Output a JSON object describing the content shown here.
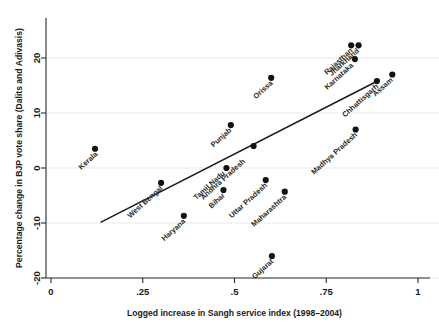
{
  "chart_data": {
    "type": "scatter",
    "title": "",
    "xlabel": "Logged increase in Sangh service index (1998–2004)",
    "ylabel": "Percentage change in BJP vote share (Dalits and Adivasis)",
    "xlim": [
      0,
      1
    ],
    "ylim": [
      -22,
      23.5
    ],
    "xticks": [
      0,
      0.25,
      0.5,
      0.75,
      1
    ],
    "xticklabels": [
      "0",
      ".25",
      ".5",
      ".75",
      "1"
    ],
    "yticks": [
      -20,
      -10,
      0,
      10,
      20
    ],
    "yticklabels": [
      "-20",
      "-10",
      "0",
      "10",
      "20"
    ],
    "grid": "horizontal",
    "legend": "none",
    "marker_color": "#121212",
    "fit_line_color": "#1a1a1a",
    "fit_line": {
      "x_start": 0.135,
      "y_start": -9.9,
      "x_end": 0.895,
      "y_end": 16.0
    },
    "points": [
      {
        "label": "Kerala",
        "x": 0.12,
        "y": 3.5,
        "label_angle": -42,
        "label_dx": 3,
        "label_dy": 6
      },
      {
        "label": "West Bengal",
        "x": 0.3,
        "y": -2.7,
        "label_angle": -42,
        "label_dx": 2,
        "label_dy": 6
      },
      {
        "label": "Haryana",
        "x": 0.362,
        "y": -8.7,
        "label_angle": -42,
        "label_dx": 2,
        "label_dy": 6
      },
      {
        "label": "Bihar",
        "x": 0.47,
        "y": -4.0,
        "label_angle": -42,
        "label_dx": 2,
        "label_dy": 6
      },
      {
        "label": "Tamil Nadu",
        "x": 0.478,
        "y": 0.0,
        "label_angle": -42,
        "label_dx": -1,
        "label_dy": 6
      },
      {
        "label": "Punjab",
        "x": 0.49,
        "y": 7.8,
        "label_angle": -42,
        "label_dx": 1,
        "label_dy": 6
      },
      {
        "label": "Andhra Pradesh",
        "x": 0.552,
        "y": 4.0,
        "label_angle": -42,
        "label_dx": -8,
        "label_dy": 16
      },
      {
        "label": "Uttar Pradesh",
        "x": 0.585,
        "y": -2.2,
        "label_angle": -42,
        "label_dx": 2,
        "label_dy": 6
      },
      {
        "label": "Orissa",
        "x": 0.6,
        "y": 16.4,
        "label_angle": -42,
        "label_dx": 2,
        "label_dy": 6
      },
      {
        "label": "Gujarat",
        "x": 0.602,
        "y": -16.0,
        "label_angle": -42,
        "label_dx": 2,
        "label_dy": 6
      },
      {
        "label": "Maharashtra",
        "x": 0.637,
        "y": -4.3,
        "label_angle": -42,
        "label_dx": 2,
        "label_dy": 6
      },
      {
        "label": "Rajasthan",
        "x": 0.818,
        "y": 22.3,
        "label_angle": -42,
        "label_dx": 2,
        "label_dy": 6
      },
      {
        "label": "Jharkhand",
        "x": 0.838,
        "y": 22.3,
        "label_angle": -42,
        "label_dx": 1,
        "label_dy": 6
      },
      {
        "label": "Karnataka",
        "x": 0.828,
        "y": 19.8,
        "label_angle": -42,
        "label_dx": -1,
        "label_dy": 7
      },
      {
        "label": "Madhya Pradesh",
        "x": 0.83,
        "y": 7.0,
        "label_angle": -42,
        "label_dx": 2,
        "label_dy": 6
      },
      {
        "label": "Chhattisgarh",
        "x": 0.888,
        "y": 15.8,
        "label_angle": -42,
        "label_dx": 2,
        "label_dy": 6
      },
      {
        "label": "Assam",
        "x": 0.93,
        "y": 17.0,
        "label_angle": -42,
        "label_dx": 1,
        "label_dy": 6
      }
    ]
  }
}
